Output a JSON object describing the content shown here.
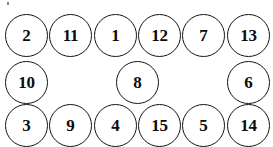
{
  "canvas": {
    "width": 273,
    "height": 147,
    "background": "#ffffff",
    "title": "numbered circle node layout"
  },
  "style": {
    "node_fill": "#ffffff",
    "node_stroke": "#141414",
    "label_color": "#0b0b0b",
    "node_diameter": 43
  },
  "artifact": {
    "name": "stray-speck",
    "x": 7,
    "y": 2
  },
  "rows": [
    {
      "name": "row-top",
      "y": 14,
      "nodes": [
        {
          "label": "2",
          "x": 5
        },
        {
          "label": "11",
          "x": 49
        },
        {
          "label": "1",
          "x": 94
        },
        {
          "label": "12",
          "x": 138
        },
        {
          "label": "7",
          "x": 182
        },
        {
          "label": "13",
          "x": 227
        }
      ]
    },
    {
      "name": "row-middle",
      "y": 61,
      "nodes": [
        {
          "label": "10",
          "x": 5
        },
        {
          "label": "8",
          "x": 116
        },
        {
          "label": "6",
          "x": 227
        }
      ]
    },
    {
      "name": "row-bottom",
      "y": 104,
      "nodes": [
        {
          "label": "3",
          "x": 5
        },
        {
          "label": "9",
          "x": 49
        },
        {
          "label": "4",
          "x": 94
        },
        {
          "label": "15",
          "x": 138
        },
        {
          "label": "5",
          "x": 182
        },
        {
          "label": "14",
          "x": 227
        }
      ]
    }
  ]
}
